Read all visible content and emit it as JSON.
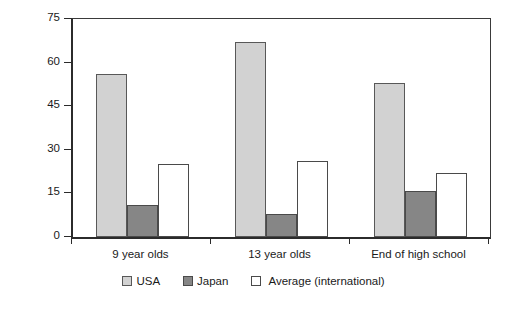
{
  "chart_data": {
    "type": "bar",
    "title": "",
    "xlabel": "",
    "ylabel": "No. of Topics",
    "categories": [
      "9 year olds",
      "13 year olds",
      "End of high school"
    ],
    "series": [
      {
        "name": "USA",
        "color": "#d2d2d2",
        "values": [
          56,
          67,
          53
        ]
      },
      {
        "name": "Japan",
        "color": "#868686",
        "values": [
          11,
          8,
          16
        ]
      },
      {
        "name": "Average (international)",
        "color": "#ffffff",
        "values": [
          25,
          26,
          22
        ]
      }
    ],
    "ylim": [
      0,
      75
    ],
    "yticks": [
      0,
      15,
      30,
      45,
      60,
      75
    ],
    "ytick_labels": [
      "0",
      "15",
      "30",
      "45",
      "60",
      "75"
    ],
    "grid": false,
    "legend_position": "bottom"
  },
  "axis": {
    "y_title": "No. of Topics"
  },
  "legend": {
    "items": [
      {
        "label": "USA",
        "swatch": "usa-swatch"
      },
      {
        "label": "Japan",
        "swatch": "japan-swatch"
      },
      {
        "label": "Average (international)",
        "swatch": "average-swatch"
      }
    ]
  }
}
